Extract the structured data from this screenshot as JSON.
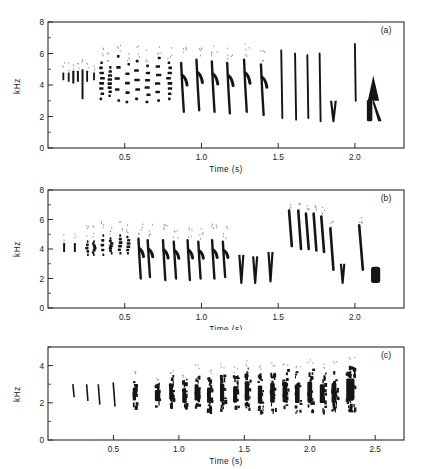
{
  "figure": {
    "background": "#ffffff",
    "ink_color": "#151515",
    "panels": [
      "a",
      "b",
      "c"
    ]
  },
  "chart_data": [
    {
      "type": "heatmap",
      "panel_label": "(a)",
      "title": "",
      "xlabel": "Time  (s)",
      "ylabel": "kHz",
      "xlim": [
        0.0,
        2.32
      ],
      "ylim": [
        0,
        8
      ],
      "xticks": [
        0.5,
        1.0,
        1.5,
        2.0
      ],
      "xticklabels": [
        "0.5",
        "1.0",
        "1.5",
        "2.0"
      ],
      "yticks": [
        0,
        2,
        4,
        6,
        8
      ],
      "yticklabels": [
        "0",
        "2",
        "4",
        "6",
        "8"
      ],
      "y_minor_ticks": [
        1,
        3,
        5,
        7
      ],
      "grid": false,
      "legend": "none",
      "description": "Bird song spectrogram: introductory notes near 4.5 kHz, a series of broadband downslurred syllables descending from 5 to 2 kHz, then tall narrow upstrokes reaching 6.5 kHz, ending in a dark triangular terminal flourish near 2-4.5 kHz.",
      "elements": [
        {
          "kind": "note",
          "t": 0.1,
          "f_hi": 4.8,
          "f_lo": 4.3,
          "w": 0.012,
          "ink": 0.6
        },
        {
          "kind": "note",
          "t": 0.135,
          "f_hi": 4.8,
          "f_lo": 4.2,
          "w": 0.012,
          "ink": 0.8
        },
        {
          "kind": "note",
          "t": 0.165,
          "f_hi": 4.9,
          "f_lo": 4.1,
          "w": 0.014,
          "ink": 0.9
        },
        {
          "kind": "note",
          "t": 0.195,
          "f_hi": 4.9,
          "f_lo": 4.2,
          "w": 0.013,
          "ink": 0.8
        },
        {
          "kind": "note",
          "t": 0.225,
          "f_hi": 5.0,
          "f_lo": 3.1,
          "w": 0.013,
          "ink": 0.9
        },
        {
          "kind": "note",
          "t": 0.255,
          "f_hi": 4.9,
          "f_lo": 4.2,
          "w": 0.012,
          "ink": 0.7
        },
        {
          "kind": "note",
          "t": 0.3,
          "f_hi": 4.8,
          "f_lo": 4.3,
          "w": 0.012,
          "ink": 0.6
        },
        {
          "kind": "syll",
          "t": 0.35,
          "f_hi": 5.5,
          "f_lo": 3.2,
          "w": 0.03,
          "ink": 1.0
        },
        {
          "kind": "syll",
          "t": 0.4,
          "f_hi": 5.2,
          "f_lo": 3.4,
          "w": 0.028,
          "ink": 0.95
        },
        {
          "kind": "syll",
          "t": 0.455,
          "f_hi": 5.9,
          "f_lo": 3.1,
          "w": 0.032,
          "ink": 1.0
        },
        {
          "kind": "syll",
          "t": 0.52,
          "f_hi": 5.4,
          "f_lo": 3.0,
          "w": 0.03,
          "ink": 1.0
        },
        {
          "kind": "syll",
          "t": 0.58,
          "f_hi": 5.6,
          "f_lo": 3.2,
          "w": 0.034,
          "ink": 1.0
        },
        {
          "kind": "syll",
          "t": 0.65,
          "f_hi": 5.3,
          "f_lo": 3.0,
          "w": 0.032,
          "ink": 1.0
        },
        {
          "kind": "syll",
          "t": 0.72,
          "f_hi": 5.8,
          "f_lo": 3.1,
          "w": 0.034,
          "ink": 1.0
        },
        {
          "kind": "syll",
          "t": 0.79,
          "f_hi": 5.5,
          "f_lo": 3.2,
          "w": 0.03,
          "ink": 1.0
        },
        {
          "kind": "dsweep",
          "t": 0.88,
          "f_hi": 5.4,
          "f_lo": 2.3,
          "w": 0.035,
          "ink": 1.0
        },
        {
          "kind": "dsweep",
          "t": 0.98,
          "f_hi": 5.6,
          "f_lo": 2.4,
          "w": 0.035,
          "ink": 1.0
        },
        {
          "kind": "dsweep",
          "t": 1.08,
          "f_hi": 5.5,
          "f_lo": 2.3,
          "w": 0.035,
          "ink": 1.0
        },
        {
          "kind": "dsweep",
          "t": 1.18,
          "f_hi": 5.4,
          "f_lo": 2.2,
          "w": 0.035,
          "ink": 1.0
        },
        {
          "kind": "dsweep",
          "t": 1.29,
          "f_hi": 5.6,
          "f_lo": 2.3,
          "w": 0.035,
          "ink": 1.0
        },
        {
          "kind": "dsweep",
          "t": 1.4,
          "f_hi": 5.3,
          "f_lo": 2.1,
          "w": 0.035,
          "ink": 1.0
        },
        {
          "kind": "spike",
          "t": 1.52,
          "f_hi": 6.2,
          "f_lo": 1.9,
          "w": 0.012,
          "ink": 1.0
        },
        {
          "kind": "spike",
          "t": 1.61,
          "f_hi": 6.0,
          "f_lo": 1.8,
          "w": 0.012,
          "ink": 1.0
        },
        {
          "kind": "spike",
          "t": 1.69,
          "f_hi": 5.9,
          "f_lo": 1.9,
          "w": 0.011,
          "ink": 1.0
        },
        {
          "kind": "spike",
          "t": 1.77,
          "f_hi": 6.0,
          "f_lo": 1.7,
          "w": 0.011,
          "ink": 1.0
        },
        {
          "kind": "vnote",
          "t": 1.86,
          "f_hi": 3.0,
          "f_lo": 1.7,
          "w": 0.03,
          "ink": 1.0
        },
        {
          "kind": "spike",
          "t": 2.0,
          "f_hi": 6.6,
          "f_lo": 3.0,
          "w": 0.009,
          "ink": 1.0
        },
        {
          "kind": "buzz",
          "t": 2.12,
          "f_hi": 4.6,
          "f_lo": 1.7,
          "w": 0.105,
          "ink": 1.0
        }
      ]
    },
    {
      "type": "heatmap",
      "panel_label": "(b)",
      "title": "",
      "xlabel": "Time  (s)",
      "ylabel": "kHz",
      "xlim": [
        0.0,
        2.32
      ],
      "ylim": [
        0,
        8
      ],
      "xticks": [
        0.5,
        1.0,
        1.5,
        2.0
      ],
      "xticklabels": [
        "0.5",
        "1.0",
        "1.5",
        "2.0"
      ],
      "yticks": [
        0,
        2,
        4,
        6,
        8
      ],
      "yticklabels": [
        "0",
        "2",
        "4",
        "6",
        "8"
      ],
      "y_minor_ticks": [
        1,
        3,
        5,
        7
      ],
      "grid": false,
      "legend": "none",
      "description": "Bird song spectrogram: sparse introductory downslurs near 4 kHz, a middle series of V-shaped syllables sweeping 4.5 to 2 kHz, a burst of steep high downslurs peaking 6.5 kHz around 1.6-1.8 s, then a terminal solid dark block near 2 kHz.",
      "elements": [
        {
          "kind": "note",
          "t": 0.105,
          "f_hi": 4.4,
          "f_lo": 3.8,
          "w": 0.013,
          "ink": 1.0
        },
        {
          "kind": "note",
          "t": 0.175,
          "f_hi": 4.4,
          "f_lo": 3.8,
          "w": 0.013,
          "ink": 1.0
        },
        {
          "kind": "syll",
          "t": 0.255,
          "f_hi": 4.6,
          "f_lo": 3.7,
          "w": 0.02,
          "ink": 1.0
        },
        {
          "kind": "syll",
          "t": 0.3,
          "f_hi": 4.6,
          "f_lo": 3.7,
          "w": 0.02,
          "ink": 1.0
        },
        {
          "kind": "syll",
          "t": 0.355,
          "f_hi": 5.0,
          "f_lo": 3.7,
          "w": 0.022,
          "ink": 1.0
        },
        {
          "kind": "syll",
          "t": 0.41,
          "f_hi": 4.8,
          "f_lo": 3.8,
          "w": 0.022,
          "ink": 1.0
        },
        {
          "kind": "syll",
          "t": 0.47,
          "f_hi": 5.0,
          "f_lo": 3.8,
          "w": 0.024,
          "ink": 1.0
        },
        {
          "kind": "syll",
          "t": 0.52,
          "f_hi": 4.9,
          "f_lo": 3.8,
          "w": 0.024,
          "ink": 1.0
        },
        {
          "kind": "dsweep",
          "t": 0.6,
          "f_hi": 4.7,
          "f_lo": 2.0,
          "w": 0.03,
          "ink": 1.0
        },
        {
          "kind": "dsweep",
          "t": 0.66,
          "f_hi": 4.6,
          "f_lo": 2.1,
          "w": 0.03,
          "ink": 1.0
        },
        {
          "kind": "dsweep",
          "t": 0.76,
          "f_hi": 4.6,
          "f_lo": 1.9,
          "w": 0.03,
          "ink": 1.0
        },
        {
          "kind": "dsweep",
          "t": 0.83,
          "f_hi": 4.5,
          "f_lo": 2.0,
          "w": 0.03,
          "ink": 1.0
        },
        {
          "kind": "dsweep",
          "t": 0.92,
          "f_hi": 4.6,
          "f_lo": 1.9,
          "w": 0.03,
          "ink": 1.0
        },
        {
          "kind": "dsweep",
          "t": 0.99,
          "f_hi": 4.5,
          "f_lo": 2.0,
          "w": 0.03,
          "ink": 1.0
        },
        {
          "kind": "dsweep",
          "t": 1.08,
          "f_hi": 4.6,
          "f_lo": 2.0,
          "w": 0.03,
          "ink": 1.0
        },
        {
          "kind": "dsweep",
          "t": 1.15,
          "f_hi": 4.5,
          "f_lo": 2.1,
          "w": 0.03,
          "ink": 1.0
        },
        {
          "kind": "vnote",
          "t": 1.26,
          "f_hi": 3.6,
          "f_lo": 1.7,
          "w": 0.026,
          "ink": 1.0
        },
        {
          "kind": "vnote",
          "t": 1.35,
          "f_hi": 3.5,
          "f_lo": 1.7,
          "w": 0.026,
          "ink": 1.0
        },
        {
          "kind": "vnote",
          "t": 1.45,
          "f_hi": 3.8,
          "f_lo": 1.8,
          "w": 0.026,
          "ink": 1.0
        },
        {
          "kind": "hsweep",
          "t": 1.58,
          "f_hi": 6.6,
          "f_lo": 4.2,
          "w": 0.018,
          "ink": 1.0
        },
        {
          "kind": "hsweep",
          "t": 1.64,
          "f_hi": 6.6,
          "f_lo": 4.0,
          "w": 0.018,
          "ink": 1.0
        },
        {
          "kind": "hsweep",
          "t": 1.69,
          "f_hi": 6.4,
          "f_lo": 4.0,
          "w": 0.018,
          "ink": 1.0
        },
        {
          "kind": "hsweep",
          "t": 1.74,
          "f_hi": 6.4,
          "f_lo": 3.9,
          "w": 0.018,
          "ink": 1.0
        },
        {
          "kind": "hsweep",
          "t": 1.79,
          "f_hi": 6.2,
          "f_lo": 3.8,
          "w": 0.018,
          "ink": 1.0
        },
        {
          "kind": "hsweep",
          "t": 1.85,
          "f_hi": 5.4,
          "f_lo": 2.6,
          "w": 0.02,
          "ink": 1.0
        },
        {
          "kind": "vnote",
          "t": 1.92,
          "f_hi": 3.0,
          "f_lo": 1.7,
          "w": 0.022,
          "ink": 1.0
        },
        {
          "kind": "hsweep",
          "t": 2.04,
          "f_hi": 5.6,
          "f_lo": 2.6,
          "w": 0.024,
          "ink": 1.0
        },
        {
          "kind": "block",
          "t": 2.135,
          "f_hi": 2.8,
          "f_lo": 1.7,
          "w": 0.06,
          "ink": 1.0
        }
      ]
    },
    {
      "type": "heatmap",
      "panel_label": "(c)",
      "title": "",
      "xlabel": "Time  (s)",
      "ylabel": "kHz",
      "xlim": [
        0.0,
        2.72
      ],
      "ylim": [
        0,
        5
      ],
      "xticks": [
        0.5,
        1.0,
        1.5,
        2.0,
        2.5
      ],
      "xticklabels": [
        "0.5",
        "1.0",
        "1.5",
        "2.0",
        "2.5"
      ],
      "yticks": [
        0,
        2,
        4
      ],
      "yticklabels": [
        "0",
        "2",
        "4"
      ],
      "y_minor_ticks": [
        1,
        3,
        5
      ],
      "grid": false,
      "legend": "none",
      "description": "Bird song spectrogram: faint thin downslurs from 3 to 2 kHz at the start, progressively denser broadband noisy syllables concentrated between 1.5 and 4 kHz, accelerating into a near-continuous dark trill that ends abruptly at about 2.4 s.",
      "elements": [
        {
          "kind": "thin",
          "t": 0.195,
          "f_hi": 3.0,
          "f_lo": 2.3,
          "w": 0.01,
          "ink": 1.0
        },
        {
          "kind": "thin",
          "t": 0.3,
          "f_hi": 3.0,
          "f_lo": 2.1,
          "w": 0.01,
          "ink": 1.0
        },
        {
          "kind": "thin",
          "t": 0.39,
          "f_hi": 3.0,
          "f_lo": 1.9,
          "w": 0.012,
          "ink": 1.0
        },
        {
          "kind": "thin",
          "t": 0.505,
          "f_hi": 3.1,
          "f_lo": 1.8,
          "w": 0.014,
          "ink": 1.0
        },
        {
          "kind": "noisy",
          "t": 0.66,
          "f_hi": 3.3,
          "f_lo": 1.8,
          "w": 0.03,
          "ink": 1.0
        },
        {
          "kind": "noisy",
          "t": 0.83,
          "f_hi": 3.1,
          "f_lo": 1.8,
          "w": 0.032,
          "ink": 1.0
        },
        {
          "kind": "noisy",
          "t": 0.94,
          "f_hi": 3.5,
          "f_lo": 1.8,
          "w": 0.034,
          "ink": 1.0
        },
        {
          "kind": "noisy",
          "t": 1.04,
          "f_hi": 3.3,
          "f_lo": 1.7,
          "w": 0.034,
          "ink": 1.0
        },
        {
          "kind": "noisy",
          "t": 1.135,
          "f_hi": 3.6,
          "f_lo": 1.7,
          "w": 0.036,
          "ink": 1.0
        },
        {
          "kind": "noisy",
          "t": 1.23,
          "f_hi": 3.4,
          "f_lo": 1.6,
          "w": 0.036,
          "ink": 1.0
        },
        {
          "kind": "noisy",
          "t": 1.33,
          "f_hi": 3.7,
          "f_lo": 1.6,
          "w": 0.038,
          "ink": 1.0
        },
        {
          "kind": "noisy",
          "t": 1.43,
          "f_hi": 3.5,
          "f_lo": 1.6,
          "w": 0.038,
          "ink": 1.0
        },
        {
          "kind": "noisy",
          "t": 1.52,
          "f_hi": 3.9,
          "f_lo": 1.6,
          "w": 0.04,
          "ink": 1.0
        },
        {
          "kind": "noisy",
          "t": 1.62,
          "f_hi": 3.6,
          "f_lo": 1.5,
          "w": 0.04,
          "ink": 1.0
        },
        {
          "kind": "noisy",
          "t": 1.715,
          "f_hi": 3.8,
          "f_lo": 1.5,
          "w": 0.042,
          "ink": 1.0
        },
        {
          "kind": "noisy",
          "t": 1.81,
          "f_hi": 3.9,
          "f_lo": 1.5,
          "w": 0.042,
          "ink": 1.0
        },
        {
          "kind": "noisy",
          "t": 1.905,
          "f_hi": 3.7,
          "f_lo": 1.5,
          "w": 0.042,
          "ink": 1.0
        },
        {
          "kind": "noisy",
          "t": 2.0,
          "f_hi": 3.9,
          "f_lo": 1.5,
          "w": 0.044,
          "ink": 1.0
        },
        {
          "kind": "noisy",
          "t": 2.095,
          "f_hi": 3.7,
          "f_lo": 1.5,
          "w": 0.044,
          "ink": 1.0
        },
        {
          "kind": "noisy",
          "t": 2.185,
          "f_hi": 3.8,
          "f_lo": 1.5,
          "w": 0.044,
          "ink": 1.0
        },
        {
          "kind": "trill",
          "t": 2.31,
          "f_hi": 4.1,
          "f_lo": 1.6,
          "w": 0.075,
          "ink": 1.0
        }
      ]
    }
  ]
}
